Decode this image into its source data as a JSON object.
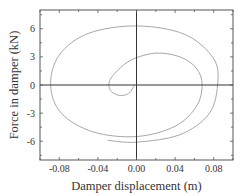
{
  "chart_data": {
    "type": "line",
    "title": "",
    "xlabel": "Damper displacement (m)",
    "ylabel": "Force in damper (kN)",
    "xlim": [
      -0.1,
      0.1
    ],
    "ylim": [
      -8,
      8
    ],
    "xticks": [
      "-0.08",
      "-0.04",
      "0.00",
      "0.04",
      "0.08"
    ],
    "yticks": [
      "-6",
      "-3",
      "0",
      "3",
      "6"
    ],
    "grid": false,
    "legend": null,
    "series": [
      {
        "name": "hysteresis spiral",
        "color": "#a8a8a8",
        "points": [
          [
            -0.002,
            0.0
          ],
          [
            -0.008,
            -0.9
          ],
          [
            -0.018,
            -1.1
          ],
          [
            -0.027,
            -0.6
          ],
          [
            -0.028,
            0.4
          ],
          [
            -0.02,
            1.5
          ],
          [
            -0.005,
            2.7
          ],
          [
            0.02,
            3.4
          ],
          [
            0.045,
            3.0
          ],
          [
            0.062,
            1.8
          ],
          [
            0.068,
            0.0
          ],
          [
            0.062,
            -2.3
          ],
          [
            0.04,
            -4.4
          ],
          [
            0.0,
            -5.5
          ],
          [
            -0.045,
            -5.0
          ],
          [
            -0.078,
            -3.0
          ],
          [
            -0.089,
            0.0
          ],
          [
            -0.08,
            3.2
          ],
          [
            -0.05,
            5.5
          ],
          [
            0.0,
            6.3
          ],
          [
            0.05,
            5.4
          ],
          [
            0.08,
            2.8
          ],
          [
            0.084,
            0.0
          ],
          [
            0.075,
            -3.1
          ],
          [
            0.045,
            -5.3
          ],
          [
            0.0,
            -6.1
          ],
          [
            -0.03,
            -5.9
          ]
        ]
      }
    ]
  }
}
